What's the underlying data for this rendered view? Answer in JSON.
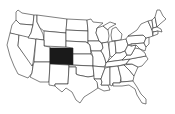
{
  "map": {
    "type": "us-states-outline",
    "highlighted_state": "Colorado",
    "colors": {
      "background": "#ffffff",
      "state_fill": "#ffffff",
      "state_stroke": "#2a2a2a",
      "highlight_fill": "#1a1a1a"
    }
  }
}
